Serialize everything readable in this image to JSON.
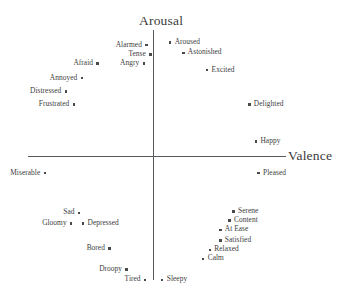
{
  "chart_data": {
    "type": "scatter",
    "title": "",
    "xlabel": "Valence",
    "ylabel": "Arousal",
    "grid": false,
    "legend": null,
    "axes": {
      "style": "crossed-at-origin",
      "x_axis_label": "Valence",
      "y_axis_label": "Arousal",
      "xlim": [
        -1,
        1
      ],
      "ylim": [
        -1,
        1
      ],
      "tick_labels": []
    },
    "points": [
      {
        "label": "Alarmed",
        "x": -0.05,
        "y": 0.84,
        "label_side": "left"
      },
      {
        "label": "Tense",
        "x": -0.02,
        "y": 0.77,
        "label_side": "left"
      },
      {
        "label": "Angry",
        "x": -0.07,
        "y": 0.7,
        "label_side": "left"
      },
      {
        "label": "Afraid",
        "x": -0.42,
        "y": 0.7,
        "label_side": "left"
      },
      {
        "label": "Annoyed",
        "x": -0.54,
        "y": 0.59,
        "label_side": "left"
      },
      {
        "label": "Distressed",
        "x": -0.66,
        "y": 0.49,
        "label_side": "left"
      },
      {
        "label": "Frustrated",
        "x": -0.6,
        "y": 0.39,
        "label_side": "left"
      },
      {
        "label": "Aroused",
        "x": 0.13,
        "y": 0.86,
        "label_side": "right"
      },
      {
        "label": "Astonished",
        "x": 0.23,
        "y": 0.78,
        "label_side": "right"
      },
      {
        "label": "Excited",
        "x": 0.41,
        "y": 0.65,
        "label_side": "right"
      },
      {
        "label": "Delighted",
        "x": 0.73,
        "y": 0.39,
        "label_side": "right"
      },
      {
        "label": "Happy",
        "x": 0.78,
        "y": 0.11,
        "label_side": "right"
      },
      {
        "label": "Pleased",
        "x": 0.8,
        "y": -0.13,
        "label_side": "right"
      },
      {
        "label": "Serene",
        "x": 0.61,
        "y": -0.42,
        "label_side": "right"
      },
      {
        "label": "Content",
        "x": 0.58,
        "y": -0.49,
        "label_side": "right"
      },
      {
        "label": "At Ease",
        "x": 0.51,
        "y": -0.56,
        "label_side": "right"
      },
      {
        "label": "Satisfied",
        "x": 0.51,
        "y": -0.64,
        "label_side": "right"
      },
      {
        "label": "Relaxed",
        "x": 0.43,
        "y": -0.71,
        "label_side": "right"
      },
      {
        "label": "Calm",
        "x": 0.38,
        "y": -0.78,
        "label_side": "right"
      },
      {
        "label": "Miserable",
        "x": -0.82,
        "y": -0.13,
        "label_side": "left"
      },
      {
        "label": "Sad",
        "x": -0.56,
        "y": -0.43,
        "label_side": "left"
      },
      {
        "label": "Gloomy",
        "x": -0.62,
        "y": -0.51,
        "label_side": "left"
      },
      {
        "label": "Depressed",
        "x": -0.53,
        "y": -0.51,
        "label_side": "right"
      },
      {
        "label": "Bored",
        "x": -0.33,
        "y": -0.7,
        "label_side": "left"
      },
      {
        "label": "Droopy",
        "x": -0.2,
        "y": -0.86,
        "label_side": "left"
      },
      {
        "label": "Tired",
        "x": -0.06,
        "y": -0.94,
        "label_side": "left"
      },
      {
        "label": "Sleepy",
        "x": 0.07,
        "y": -0.94,
        "label_side": "right"
      }
    ],
    "colors": {
      "marker": "#4a4a4a",
      "axis": "#555a5e",
      "label_text": "#3d3d3d",
      "axis_title_text": "#3a3a3a",
      "background": "#ffffff"
    }
  }
}
